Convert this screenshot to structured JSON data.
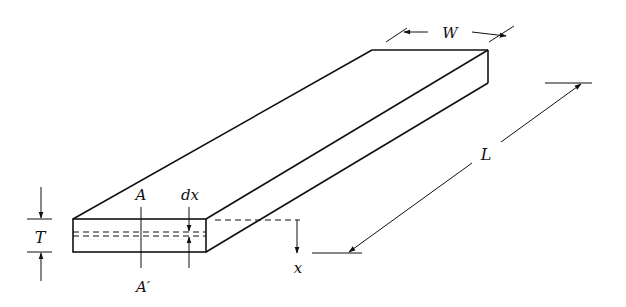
{
  "diagram": {
    "colors": {
      "stroke": "#111111",
      "background": "#ffffff"
    },
    "labels": {
      "width": "W",
      "length": "L",
      "thickness": "T",
      "section_top": "A",
      "section_bottom": "A′",
      "element": "dx",
      "depth": "x"
    }
  }
}
